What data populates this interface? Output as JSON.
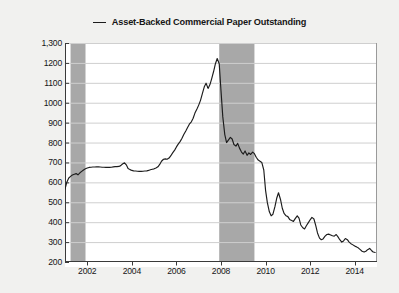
{
  "legend": {
    "marker": "line-dash-marker",
    "label": "Asset-Backed Commercial Paper Outstanding"
  },
  "axes": {
    "ylabel": "(Billions of Dollars)",
    "xlabel": ""
  },
  "chart_data": {
    "type": "line",
    "title": "Asset-Backed Commercial Paper Outstanding",
    "xlabel": "",
    "ylabel": "(Billions of Dollars)",
    "xlim": [
      2001.0,
      2015.0
    ],
    "ylim": [
      200,
      1300
    ],
    "ytick_labels": [
      "1,300",
      "1200",
      "1100",
      "1000",
      "900",
      "800",
      "700",
      "600",
      "500",
      "400",
      "300",
      "200"
    ],
    "ytick_values": [
      1300,
      1200,
      1100,
      1000,
      900,
      800,
      700,
      600,
      500,
      400,
      300,
      200
    ],
    "xtick_labels": [
      "2002",
      "2004",
      "2006",
      "2008",
      "2010",
      "2012",
      "2014"
    ],
    "xtick_values": [
      2002,
      2004,
      2006,
      2008,
      2010,
      2012,
      2014
    ],
    "grid": "horizontal",
    "legend_position": "top-center",
    "line_color": "#1c1c1c",
    "plot_background": "#ffffff",
    "grid_color": "#cfcfcf",
    "shaded_band_color": "#a8a8a8",
    "shaded_bands": [
      {
        "name": "recession-2001",
        "start": 2001.25,
        "end": 2001.92
      },
      {
        "name": "recession-2007-2009",
        "start": 2007.92,
        "end": 2009.5
      }
    ],
    "series": [
      {
        "name": "Asset-Backed Commercial Paper Outstanding",
        "x": [
          2001.0,
          2001.08,
          2001.17,
          2001.25,
          2001.33,
          2001.42,
          2001.5,
          2001.58,
          2001.67,
          2001.75,
          2001.83,
          2001.92,
          2002.0,
          2002.08,
          2002.17,
          2002.25,
          2002.33,
          2002.42,
          2002.5,
          2002.58,
          2002.67,
          2002.75,
          2002.83,
          2002.92,
          2003.0,
          2003.08,
          2003.17,
          2003.25,
          2003.33,
          2003.42,
          2003.5,
          2003.58,
          2003.67,
          2003.75,
          2003.83,
          2003.92,
          2004.0,
          2004.08,
          2004.17,
          2004.25,
          2004.33,
          2004.42,
          2004.5,
          2004.58,
          2004.67,
          2004.75,
          2004.83,
          2004.92,
          2005.0,
          2005.08,
          2005.17,
          2005.25,
          2005.33,
          2005.42,
          2005.5,
          2005.58,
          2005.67,
          2005.75,
          2005.83,
          2005.92,
          2006.0,
          2006.08,
          2006.17,
          2006.25,
          2006.33,
          2006.42,
          2006.5,
          2006.58,
          2006.67,
          2006.75,
          2006.83,
          2006.92,
          2007.0,
          2007.08,
          2007.17,
          2007.25,
          2007.33,
          2007.42,
          2007.5,
          2007.58,
          2007.67,
          2007.75,
          2007.83,
          2007.92,
          2008.0,
          2008.08,
          2008.17,
          2008.25,
          2008.33,
          2008.42,
          2008.5,
          2008.58,
          2008.67,
          2008.75,
          2008.83,
          2008.92,
          2009.0,
          2009.08,
          2009.17,
          2009.25,
          2009.33,
          2009.42,
          2009.5,
          2009.58,
          2009.67,
          2009.75,
          2009.83,
          2009.92,
          2010.0,
          2010.08,
          2010.17,
          2010.25,
          2010.33,
          2010.42,
          2010.5,
          2010.58,
          2010.67,
          2010.75,
          2010.83,
          2010.92,
          2011.0,
          2011.08,
          2011.17,
          2011.25,
          2011.33,
          2011.42,
          2011.5,
          2011.58,
          2011.67,
          2011.75,
          2011.83,
          2011.92,
          2012.0,
          2012.08,
          2012.17,
          2012.25,
          2012.33,
          2012.42,
          2012.5,
          2012.58,
          2012.67,
          2012.75,
          2012.83,
          2012.92,
          2013.0,
          2013.08,
          2013.17,
          2013.25,
          2013.33,
          2013.42,
          2013.5,
          2013.58,
          2013.67,
          2013.75,
          2013.83,
          2013.92,
          2014.0,
          2014.08,
          2014.17,
          2014.25,
          2014.33,
          2014.42,
          2014.5,
          2014.58,
          2014.67,
          2014.75,
          2014.83,
          2014.92
        ],
        "values": [
          566,
          600,
          622,
          630,
          637,
          641,
          644,
          638,
          648,
          655,
          662,
          668,
          672,
          675,
          676,
          677,
          677,
          678,
          678,
          677,
          676,
          676,
          675,
          676,
          675,
          676,
          678,
          679,
          679,
          680,
          684,
          692,
          698,
          688,
          670,
          664,
          660,
          658,
          657,
          656,
          655,
          655,
          656,
          657,
          658,
          660,
          663,
          666,
          668,
          672,
          678,
          690,
          706,
          716,
          718,
          716,
          722,
          734,
          748,
          762,
          778,
          792,
          806,
          822,
          840,
          858,
          876,
          892,
          904,
          922,
          948,
          968,
          988,
          1012,
          1048,
          1080,
          1098,
          1072,
          1090,
          1120,
          1158,
          1196,
          1222,
          1196,
          1060,
          930,
          840,
          800,
          812,
          826,
          818,
          790,
          782,
          796,
          772,
          752,
          742,
          758,
          736,
          748,
          740,
          752,
          744,
          726,
          712,
          706,
          700,
          662,
          560,
          498,
          452,
          432,
          440,
          478,
          520,
          548,
          514,
          470,
          444,
          432,
          428,
          414,
          408,
          404,
          418,
          432,
          420,
          386,
          372,
          366,
          382,
          398,
          412,
          424,
          416,
          384,
          346,
          320,
          312,
          316,
          330,
          338,
          340,
          336,
          332,
          330,
          338,
          326,
          312,
          300,
          306,
          318,
          312,
          300,
          292,
          286,
          280,
          276,
          270,
          262,
          254,
          250,
          254,
          262,
          268,
          258,
          250,
          248
        ]
      }
    ]
  }
}
